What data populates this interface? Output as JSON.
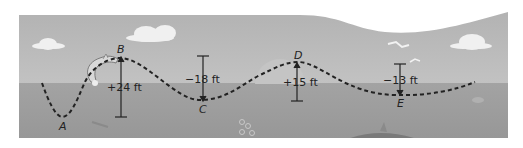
{
  "colors": {
    "sky": "#b4b4b4",
    "sea": "#9a9a9a",
    "cloud": "#f2f2f2",
    "path": "#222222",
    "background": "#ffffff"
  },
  "points": [
    {
      "id": "A",
      "label": "A"
    },
    {
      "id": "B",
      "label": "B"
    },
    {
      "id": "C",
      "label": "C"
    },
    {
      "id": "D",
      "label": "D"
    },
    {
      "id": "E",
      "label": "E"
    }
  ],
  "measures": [
    {
      "id": "AB",
      "label": "+24 ft"
    },
    {
      "id": "BC",
      "label": "−18 ft"
    },
    {
      "id": "CD",
      "label": "+15 ft"
    },
    {
      "id": "DE",
      "label": "−13 ft"
    }
  ],
  "icons": [
    "dolphin-icon",
    "cloud-icon",
    "bird-icon",
    "sun-icon",
    "shark-fin-icon",
    "fish-icon",
    "bubbles-icon",
    "crab-icon"
  ]
}
